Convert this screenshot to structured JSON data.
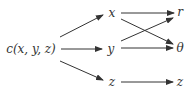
{
  "diagram": {
    "type": "variable-dependency-graph",
    "nodes": [
      {
        "id": "c",
        "label": "c(x, y, z)",
        "x": 31,
        "y": 49
      },
      {
        "id": "x",
        "label": "x",
        "x": 112,
        "y": 13
      },
      {
        "id": "y",
        "label": "y",
        "x": 111,
        "y": 49
      },
      {
        "id": "z1",
        "label": "z",
        "x": 112,
        "y": 82
      },
      {
        "id": "r",
        "label": "r",
        "x": 179,
        "y": 12
      },
      {
        "id": "theta",
        "label": "θ",
        "x": 179,
        "y": 48
      },
      {
        "id": "z2",
        "label": "z",
        "x": 179,
        "y": 82
      }
    ],
    "edges": [
      {
        "from": "c",
        "to": "x"
      },
      {
        "from": "c",
        "to": "y"
      },
      {
        "from": "c",
        "to": "z1"
      },
      {
        "from": "x",
        "to": "r"
      },
      {
        "from": "x",
        "to": "theta"
      },
      {
        "from": "y",
        "to": "r"
      },
      {
        "from": "y",
        "to": "theta"
      },
      {
        "from": "z1",
        "to": "z2"
      }
    ],
    "colors": {
      "stroke": "#333333",
      "text": "#333333",
      "background": "#ffffff"
    }
  }
}
